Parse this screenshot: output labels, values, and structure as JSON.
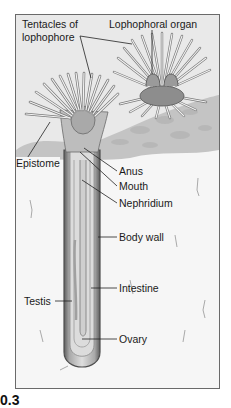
{
  "figure": {
    "caption_fragment": "0.3",
    "labels": {
      "tentacles": [
        "Tentacles of",
        "lophophore"
      ],
      "lophophoral_organ": "Lophophoral organ",
      "epistome": "Epistome",
      "anus": "Anus",
      "mouth": "Mouth",
      "nephridium": "Nephridium",
      "body_wall": "Body wall",
      "intestine": "Intestine",
      "testis": "Testis",
      "ovary": "Ovary"
    },
    "colors": {
      "frame": "#6a6a6a",
      "sediment_top": "#c9c9c9",
      "sand": "#f4f4f4",
      "tube_outer": "#6b6b6b",
      "tube_inner": "#d6d6d6",
      "tentacle": "#eeeeee",
      "label_text": "#1a1a1a"
    }
  }
}
